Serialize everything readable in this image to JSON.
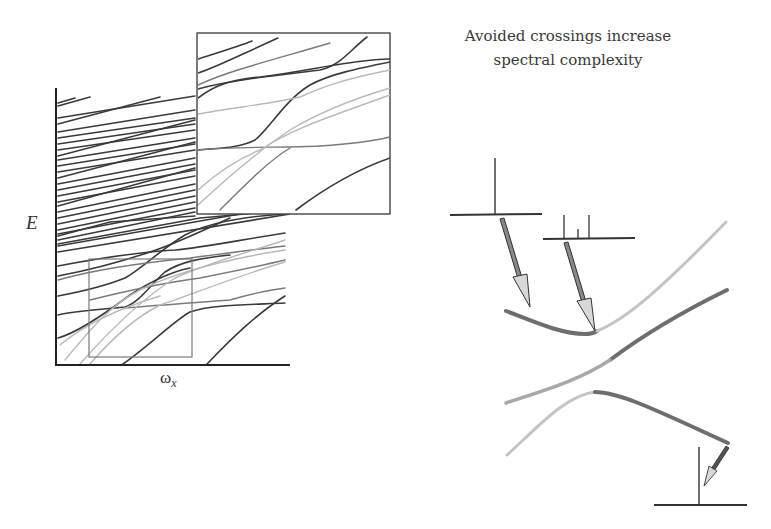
{
  "figure": {
    "title_line1": "Avoided crossings increase",
    "title_line2": "spectral complexity",
    "main_plot": {
      "y_axis_label": "E",
      "x_axis_label_base": "ω",
      "x_axis_label_sub": "x",
      "zoom_box_present": true,
      "inset_present": true
    },
    "schematic": {
      "spectra": [
        {
          "name": "single-line-spectrum",
          "sticks": 1
        },
        {
          "name": "split-spectrum",
          "sticks": 3
        },
        {
          "name": "lower-single-line-spectrum",
          "sticks": 1
        }
      ],
      "curves": [
        "upper-avoided-crossing-branch",
        "crossing-diagonal",
        "lower-avoided-crossing-branch"
      ]
    },
    "colors": {
      "dark_line": "#3a3a3a",
      "light_line": "#b8b8b8",
      "mid_line": "#7a7a7a",
      "arrow_fill": "#d8d8d8"
    }
  }
}
